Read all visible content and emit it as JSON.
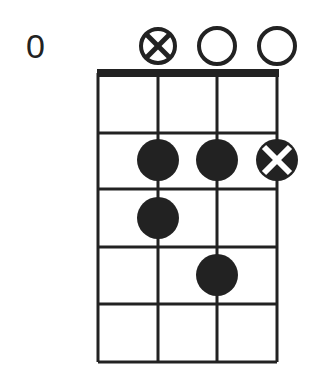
{
  "diagram": {
    "type": "chord-diagram",
    "start_fret_label": "0",
    "strings": 4,
    "frets": 5,
    "string_x": [
      98,
      158,
      217,
      277
    ],
    "fret_y": [
      73,
      133,
      189,
      247,
      304,
      362
    ],
    "top_markers": [
      {
        "string": 2,
        "type": "muted-circle-x"
      },
      {
        "string": 3,
        "type": "open"
      },
      {
        "string": 4,
        "type": "open"
      }
    ],
    "dots": [
      {
        "string": 2,
        "fret": 2,
        "type": "finger"
      },
      {
        "string": 3,
        "fret": 2,
        "type": "finger"
      },
      {
        "string": 4,
        "fret": 2,
        "type": "x-dot"
      },
      {
        "string": 2,
        "fret": 3,
        "type": "finger"
      },
      {
        "string": 3,
        "fret": 4,
        "type": "finger"
      }
    ],
    "colors": {
      "ink": "#222222",
      "background": "#ffffff"
    }
  }
}
